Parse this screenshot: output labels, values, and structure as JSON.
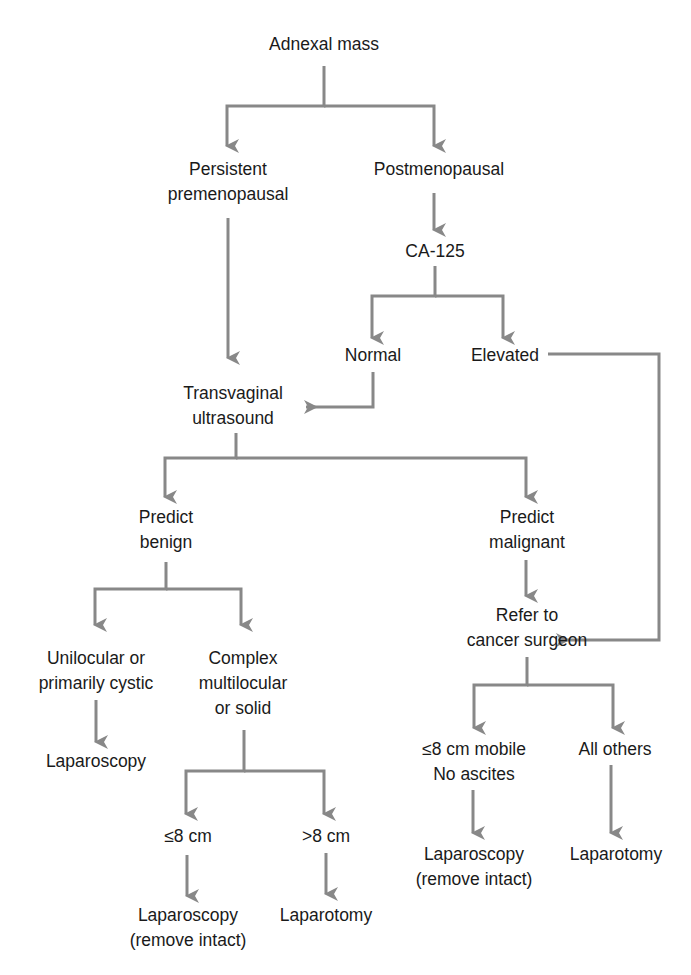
{
  "diagram": {
    "type": "flowchart",
    "line_color": "#888888",
    "text_color": "#1a1a1a",
    "nodes": {
      "adnexal_mass": {
        "lines": [
          "Adnexal mass"
        ]
      },
      "persistent_premenopausal": {
        "lines": [
          "Persistent",
          "premenopausal"
        ]
      },
      "postmenopausal": {
        "lines": [
          "Postmenopausal"
        ]
      },
      "ca125": {
        "lines": [
          "CA-125"
        ]
      },
      "normal": {
        "lines": [
          "Normal"
        ]
      },
      "elevated": {
        "lines": [
          "Elevated"
        ]
      },
      "transvaginal_ultrasound": {
        "lines": [
          "Transvaginal",
          "ultrasound"
        ]
      },
      "predict_benign": {
        "lines": [
          "Predict",
          "benign"
        ]
      },
      "predict_malignant": {
        "lines": [
          "Predict",
          "malignant"
        ]
      },
      "refer_cancer_surgeon": {
        "lines": [
          "Refer to",
          "cancer surgeon"
        ]
      },
      "unilocular": {
        "lines": [
          "Unilocular or",
          "primarily cystic"
        ]
      },
      "complex": {
        "lines": [
          "Complex",
          "multilocular",
          "or solid"
        ]
      },
      "laparoscopy_benign": {
        "lines": [
          "Laparoscopy"
        ]
      },
      "le8cm": {
        "lines": [
          "≤8 cm"
        ]
      },
      "gt8cm": {
        "lines": [
          ">8 cm"
        ]
      },
      "laparoscopy_intact_benign": {
        "lines": [
          "Laparoscopy",
          "(remove intact)"
        ]
      },
      "laparotomy_benign": {
        "lines": [
          "Laparotomy"
        ]
      },
      "le8cm_mobile": {
        "lines": [
          "≤8 cm mobile",
          "No ascites"
        ]
      },
      "all_others": {
        "lines": [
          "All others"
        ]
      },
      "laparoscopy_intact_malignant": {
        "lines": [
          "Laparoscopy",
          "(remove intact)"
        ]
      },
      "laparotomy_malignant": {
        "lines": [
          "Laparotomy"
        ]
      }
    },
    "edges": [
      [
        "adnexal_mass",
        "persistent_premenopausal"
      ],
      [
        "adnexal_mass",
        "postmenopausal"
      ],
      [
        "postmenopausal",
        "ca125"
      ],
      [
        "ca125",
        "normal"
      ],
      [
        "ca125",
        "elevated"
      ],
      [
        "persistent_premenopausal",
        "transvaginal_ultrasound"
      ],
      [
        "normal",
        "transvaginal_ultrasound"
      ],
      [
        "elevated",
        "refer_cancer_surgeon"
      ],
      [
        "transvaginal_ultrasound",
        "predict_benign"
      ],
      [
        "transvaginal_ultrasound",
        "predict_malignant"
      ],
      [
        "predict_malignant",
        "refer_cancer_surgeon"
      ],
      [
        "predict_benign",
        "unilocular"
      ],
      [
        "predict_benign",
        "complex"
      ],
      [
        "unilocular",
        "laparoscopy_benign"
      ],
      [
        "complex",
        "le8cm"
      ],
      [
        "complex",
        "gt8cm"
      ],
      [
        "le8cm",
        "laparoscopy_intact_benign"
      ],
      [
        "gt8cm",
        "laparotomy_benign"
      ],
      [
        "refer_cancer_surgeon",
        "le8cm_mobile"
      ],
      [
        "refer_cancer_surgeon",
        "all_others"
      ],
      [
        "le8cm_mobile",
        "laparoscopy_intact_malignant"
      ],
      [
        "all_others",
        "laparotomy_malignant"
      ]
    ]
  }
}
